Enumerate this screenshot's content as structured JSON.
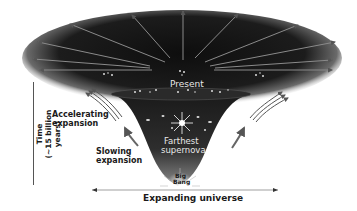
{
  "diagram": {
    "labels": {
      "present": "Present",
      "accelerating_1": "Accelerating",
      "accelerating_2": "expansion",
      "slowing_1": "Slowing",
      "slowing_2": "expansion",
      "farthest_1": "Farthest",
      "farthest_2": "supernova",
      "bigbang_1": "Big",
      "bigbang_2": "Bang",
      "x_axis": "Expanding universe",
      "y_axis_1": "Time",
      "y_axis_2": "(~15 billion years)"
    },
    "colors": {
      "funnel_dark": "#141414",
      "funnel_mid": "#3a3a3a",
      "arrow": "#666666",
      "background": "#ffffff"
    }
  }
}
